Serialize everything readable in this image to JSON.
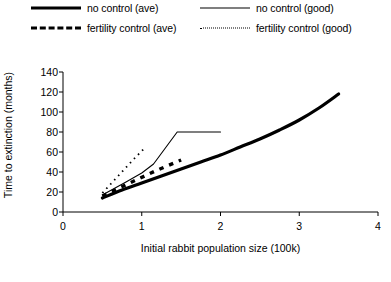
{
  "chart_data": {
    "type": "line",
    "title": "",
    "xlabel": "Initial rabbit population size (100k)",
    "ylabel": "Time to extinction (months)",
    "xlim": [
      0,
      4
    ],
    "ylim": [
      0,
      140
    ],
    "xticks": [
      0,
      1,
      2,
      3,
      4
    ],
    "yticks": [
      0,
      20,
      40,
      60,
      80,
      100,
      120,
      140
    ],
    "grid": false,
    "legend_position": "above-plot",
    "series": [
      {
        "name": "no control (ave)",
        "style": "thick-solid",
        "color": "#000000",
        "points": [
          [
            0.5,
            14
          ],
          [
            0.75,
            22
          ],
          [
            1.0,
            29
          ],
          [
            1.25,
            36
          ],
          [
            1.5,
            43
          ],
          [
            1.75,
            50
          ],
          [
            2.0,
            57
          ],
          [
            2.25,
            65
          ],
          [
            2.5,
            73
          ],
          [
            2.75,
            82
          ],
          [
            3.0,
            92
          ],
          [
            3.25,
            104
          ],
          [
            3.5,
            118
          ]
        ]
      },
      {
        "name": "no control (good)",
        "style": "thin-solid",
        "color": "#000000",
        "points": [
          [
            0.5,
            17
          ],
          [
            0.8,
            30
          ],
          [
            1.0,
            39
          ],
          [
            1.15,
            48
          ],
          [
            1.45,
            80
          ],
          [
            2.0,
            80
          ]
        ]
      },
      {
        "name": "fertility control (ave)",
        "style": "thick-dashed",
        "color": "#000000",
        "points": [
          [
            0.5,
            16
          ],
          [
            0.9,
            31
          ],
          [
            1.2,
            42
          ],
          [
            1.5,
            52
          ]
        ]
      },
      {
        "name": "fertility control (good)",
        "style": "fine-dotted",
        "color": "#000000",
        "points": [
          [
            0.5,
            19
          ],
          [
            0.7,
            36
          ],
          [
            0.9,
            53
          ],
          [
            1.05,
            65
          ]
        ]
      }
    ]
  },
  "legend": {
    "entries": [
      {
        "label": "no control (ave)",
        "style": "thick-solid"
      },
      {
        "label": "fertility control (ave)",
        "style": "thick-dashed"
      },
      {
        "label": "no control (good)",
        "style": "thin-solid"
      },
      {
        "label": "fertility control (good)",
        "style": "fine-dotted"
      }
    ]
  },
  "axes": {
    "y_title": "Time to extinction (months)",
    "x_title": "Initial rabbit population size (100k)",
    "y_tick_labels": [
      "0",
      "20",
      "40",
      "60",
      "80",
      "100",
      "120",
      "140"
    ],
    "x_tick_labels": [
      "0",
      "1",
      "2",
      "3",
      "4"
    ]
  }
}
